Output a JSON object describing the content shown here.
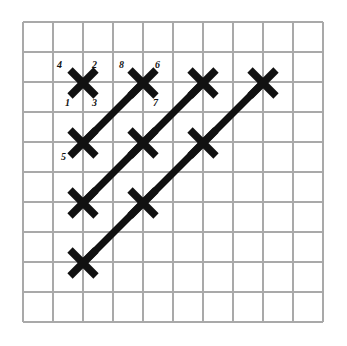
{
  "figure": {
    "background_color": "#ffffff",
    "grid": {
      "line_color": "#a9a9a9",
      "x_start": 23,
      "y_start": 22,
      "spacing": 30,
      "columns": 11,
      "rows": 11
    },
    "marks": {
      "color": "#111111",
      "arm_half_length": 13,
      "stroke_width": 7.5,
      "positions": [
        {
          "id": "m1",
          "x": 83,
          "y": 83
        },
        {
          "id": "m2",
          "x": 143,
          "y": 83
        },
        {
          "id": "m3",
          "x": 203,
          "y": 83
        },
        {
          "id": "m4",
          "x": 263,
          "y": 83
        },
        {
          "id": "m5",
          "x": 83,
          "y": 143
        },
        {
          "id": "m6",
          "x": 143,
          "y": 143
        },
        {
          "id": "m7",
          "x": 203,
          "y": 143
        },
        {
          "id": "m8",
          "x": 83,
          "y": 203
        },
        {
          "id": "m9",
          "x": 143,
          "y": 203
        },
        {
          "id": "m10",
          "x": 83,
          "y": 263
        }
      ]
    },
    "chains": {
      "color": "#111111",
      "stroke_width": 7,
      "segments": [
        {
          "id": "c1",
          "x1": 83,
          "y1": 143,
          "x2": 143,
          "y2": 83
        },
        {
          "id": "c2",
          "x1": 83,
          "y1": 203,
          "x2": 203,
          "y2": 83
        },
        {
          "id": "c3",
          "x1": 83,
          "y1": 263,
          "x2": 263,
          "y2": 83
        }
      ]
    },
    "labels": [
      {
        "id": "lbl4",
        "text": "4",
        "x": 57,
        "y": 60
      },
      {
        "id": "lbl2",
        "text": "2",
        "x": 92,
        "y": 60
      },
      {
        "id": "lbl1",
        "text": "1",
        "x": 65,
        "y": 98
      },
      {
        "id": "lbl3",
        "text": "3",
        "x": 92,
        "y": 98
      },
      {
        "id": "lbl8",
        "text": "8",
        "x": 119,
        "y": 60
      },
      {
        "id": "lbl6",
        "text": "6",
        "x": 155,
        "y": 60
      },
      {
        "id": "lbl7",
        "text": "7",
        "x": 153,
        "y": 98
      },
      {
        "id": "lbl5",
        "text": "5",
        "x": 61,
        "y": 152
      }
    ]
  }
}
